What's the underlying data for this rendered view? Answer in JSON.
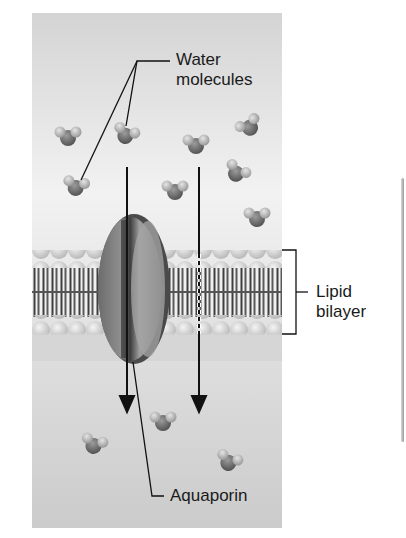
{
  "figure": {
    "type": "diagram",
    "labels": {
      "water_molecules": "Water\nmolecules",
      "lipid_bilayer": "Lipid\nbilayer",
      "aquaporin": "Aquaporin"
    },
    "colors": {
      "background_top": "#d6d6d6",
      "background_mid": "#efefef",
      "background_bottom": "#c9c9c9",
      "oxygen": "#6a6a6a",
      "hydrogen": "#b8b8b8",
      "lipid_head": "#d9d9d9",
      "lipid_tail": "#4a4a4a",
      "aquaporin": "#7a7a7a",
      "line": "#111111"
    },
    "molecules": [
      {
        "x": 68,
        "y": 136,
        "rot": 0
      },
      {
        "x": 126,
        "y": 134,
        "rot": 20
      },
      {
        "x": 196,
        "y": 144,
        "rot": 0
      },
      {
        "x": 249,
        "y": 126,
        "rot": -30
      },
      {
        "x": 76,
        "y": 186,
        "rot": 10
      },
      {
        "x": 175,
        "y": 190,
        "rot": 0
      },
      {
        "x": 237,
        "y": 172,
        "rot": 30
      },
      {
        "x": 257,
        "y": 217,
        "rot": 0
      },
      {
        "x": 163,
        "y": 421,
        "rot": 0
      },
      {
        "x": 94,
        "y": 444,
        "rot": 15
      },
      {
        "x": 229,
        "y": 461,
        "rot": 20
      }
    ],
    "arrows": [
      {
        "name": "arrow-through-aquaporin",
        "x": 127,
        "y1": 167,
        "y2": 410
      },
      {
        "name": "arrow-through-bilayer",
        "x": 199,
        "y1": 167,
        "y2": 410
      }
    ]
  }
}
